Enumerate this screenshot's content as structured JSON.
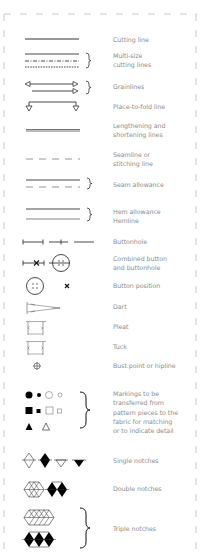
{
  "legend": {
    "items": [
      {
        "id": "cutting-line",
        "label": "Cutting line"
      },
      {
        "id": "multi-size-cutting-lines",
        "label": "Multi-size\ncutting lines",
        "label_lines": [
          "Multi-size",
          "cutting lines"
        ]
      },
      {
        "id": "grainlines",
        "label": "Grainlines"
      },
      {
        "id": "place-to-fold-line",
        "label": "Place-to-fold line"
      },
      {
        "id": "lengthening-shortening-lines",
        "label_lines": [
          "Lengthening and",
          "shortening lines"
        ]
      },
      {
        "id": "seamline",
        "label_lines": [
          "Seamline or",
          "stitching line"
        ]
      },
      {
        "id": "seam-allowance",
        "label": "Seam allowance"
      },
      {
        "id": "hem-allowance",
        "label_lines": [
          "Hem allowance",
          "Hemline"
        ]
      },
      {
        "id": "buttonhole",
        "label": "Buttonhole"
      },
      {
        "id": "combined-button-buttonhole",
        "label_lines": [
          "Combined button",
          "and buttonhole"
        ]
      },
      {
        "id": "button-position",
        "label": "Button position"
      },
      {
        "id": "dart",
        "label": "Dart"
      },
      {
        "id": "pleat",
        "label": "Pleat"
      },
      {
        "id": "tuck",
        "label": "Tuck"
      },
      {
        "id": "bust-point",
        "label": "Bust point or hipline"
      },
      {
        "id": "markings",
        "label_lines": [
          "Markings to be",
          "transferred from",
          "pattern pieces to the",
          "fabric for matching",
          "or to indicate detail"
        ]
      },
      {
        "id": "single-notches",
        "label": "Single notches"
      },
      {
        "id": "double-notches",
        "label": "Double notches"
      },
      {
        "id": "triple-notches",
        "label": "Triple notches"
      }
    ]
  },
  "colors": {
    "stroke": "#333333",
    "label_text": "#8c8c8c",
    "frame": "#b8b8b8",
    "fill": "#000000"
  }
}
